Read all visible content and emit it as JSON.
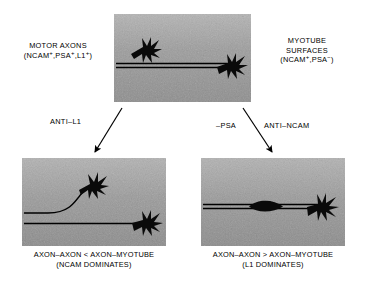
{
  "figure": {
    "type": "scientific-schematic",
    "background_color": "#ffffff",
    "panel_color": "#9a9a9a",
    "ink_color": "#000000"
  },
  "labels": {
    "left_top": {
      "name": "motor-axons-label",
      "line1": "MOTOR AXONS",
      "line2_prefix": "(NCAM",
      "line2_sup1": "+",
      "line2_mid1": ",PSA",
      "line2_sup2": "+",
      "line2_mid2": ",L1",
      "line2_sup3": "+",
      "line2_suffix": ")"
    },
    "right_top": {
      "name": "myotube-surfaces-label",
      "line1": "MYOTUBE",
      "line2": "SURFACES",
      "line3_prefix": "(NCAM",
      "line3_sup1": "+",
      "line3_mid": ",PSA",
      "line3_sup2": "−",
      "line3_suffix": ")"
    }
  },
  "arrows": {
    "left": {
      "label": "ANTI–L1",
      "from_panel": "top-panel",
      "to_panel": "bottom-left-panel"
    },
    "right": {
      "label_primary": "ANTI–NCAM",
      "label_secondary": "–PSA",
      "from_panel": "top-panel",
      "to_panel": "bottom-right-panel"
    }
  },
  "panels": {
    "top": {
      "name": "top-panel",
      "description": "Two fasciculated axons with growth cones; one growth cone at upper left, one at right end",
      "growth_cones": 2
    },
    "bottom_left": {
      "name": "bottom-left-panel",
      "description": "Defasciculated axons: upper axon curves away upward with growth cone; lower axon straight with growth cone at right",
      "growth_cones": 2
    },
    "bottom_right": {
      "name": "bottom-right-panel",
      "description": "Tightly fasciculated axons with spindle-shaped swelling midway and single growth cone at right",
      "growth_cones": 1
    }
  },
  "captions": {
    "bottom_left": {
      "name": "bottom-left-caption",
      "line1": "AXON–AXON < AXON–MYOTUBE",
      "line2": "(NCAM DOMINATES)"
    },
    "bottom_right": {
      "name": "bottom-right-caption",
      "line1": "AXON–AXON > AXON–MYOTUBE",
      "line2": "(L1 DOMINATES)"
    }
  }
}
